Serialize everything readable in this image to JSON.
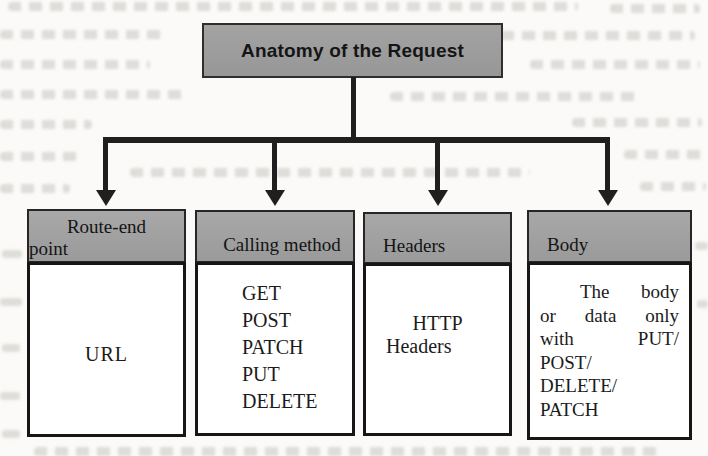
{
  "diagram": {
    "title": "Anatomy of the Request",
    "columns": [
      {
        "label": "Route-end point",
        "header_lines": [
          "Route-end",
          "point"
        ],
        "body_lines": [
          "URL"
        ]
      },
      {
        "label": "Calling method",
        "header_lines": [
          "Calling method"
        ],
        "body_lines": [
          "GET",
          "POST",
          "PATCH",
          "PUT",
          "DELETE"
        ]
      },
      {
        "label": "Headers",
        "header_lines": [
          "Headers"
        ],
        "body_lines": [
          "HTTP",
          "Headers"
        ]
      },
      {
        "label": "Body",
        "header_lines": [
          "Body"
        ],
        "body_lines": [
          "The body",
          "or data only",
          "with PUT/",
          "POST/",
          "DELETE/",
          "PATCH"
        ]
      }
    ]
  },
  "colors": {
    "title_fill": "#9b9b9b",
    "header_fill": "#a1a1a1",
    "box_border": "#262626",
    "arrow": "#1f1f1f",
    "paper": "#fbfaf8",
    "text": "#171717"
  }
}
